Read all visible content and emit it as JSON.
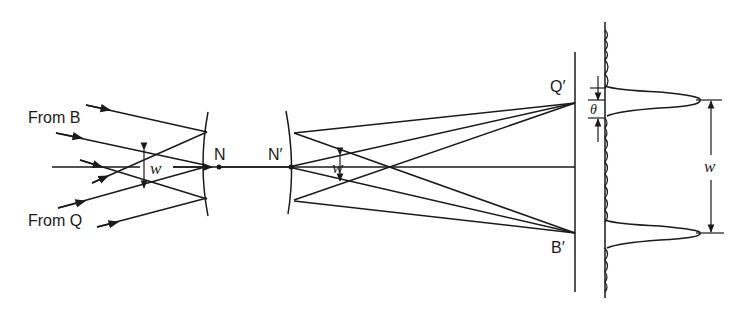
{
  "diagram": {
    "type": "optics-ray-diagram",
    "labels": {
      "from_b": "From B",
      "from_q": "From Q",
      "n": "N",
      "n_prime": "N′",
      "q_prime": "Q′",
      "b_prime": "B′",
      "w_left": "w",
      "w_middle": "w",
      "w_right": "w",
      "theta": "θ"
    },
    "elements": [
      "incoming parallel ray bundle from B",
      "incoming parallel ray bundle from Q",
      "entrance lens surface at N",
      "exit lens surface at N′",
      "optical axis",
      "image screen with points Q′ and B′",
      "intensity profile with two diffraction peaks separated by w",
      "peak angular width θ"
    ],
    "colors": {
      "ink": "#1a1a1a",
      "background": "#ffffff"
    }
  }
}
